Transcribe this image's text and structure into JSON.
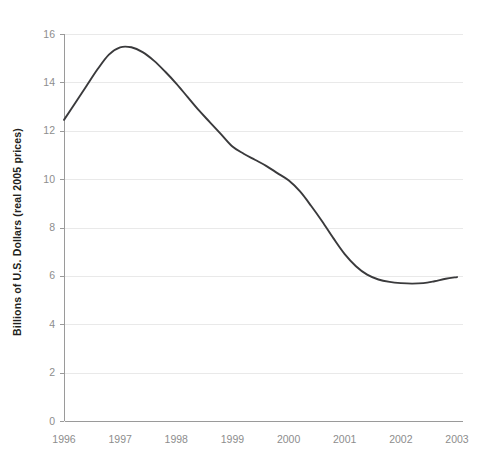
{
  "chart_data": {
    "type": "line",
    "title": "",
    "subtitle": "",
    "xlabel": "",
    "ylabel": "Billions of U.S. Dollars (real 2005 prices)",
    "xlim": [
      1996,
      2003
    ],
    "ylim": [
      0,
      16
    ],
    "y_ticks": [
      0,
      2,
      4,
      6,
      8,
      10,
      12,
      14,
      16
    ],
    "x_ticks": [
      1996,
      1997,
      1998,
      1999,
      2000,
      2001,
      2002,
      2003
    ],
    "y_tick_labels": [
      "0",
      "2",
      "4",
      "6",
      "8",
      "10",
      "12",
      "14",
      "16"
    ],
    "x_tick_labels": [
      "1996",
      "1997",
      "1998",
      "1999",
      "2000",
      "2001",
      "2002",
      "2003"
    ],
    "grid": "horizontal",
    "legend": "none",
    "series": [
      {
        "name": "Value",
        "color": "#3a3a3c",
        "x": [
          1996.0,
          1996.2,
          1996.4,
          1996.6,
          1996.8,
          1997.0,
          1997.2,
          1997.4,
          1997.6,
          1997.8,
          1998.0,
          1998.2,
          1998.4,
          1998.6,
          1998.8,
          1999.0,
          1999.2,
          1999.4,
          1999.6,
          1999.8,
          2000.0,
          2000.2,
          2000.4,
          2000.6,
          2000.8,
          2001.0,
          2001.2,
          2001.4,
          2001.6,
          2001.8,
          2002.0,
          2002.2,
          2002.4,
          2002.6,
          2002.8,
          2003.0
        ],
        "values": [
          12.45,
          13.15,
          13.85,
          14.55,
          15.15,
          15.45,
          15.45,
          15.25,
          14.9,
          14.45,
          13.95,
          13.4,
          12.85,
          12.35,
          11.85,
          11.35,
          11.05,
          10.8,
          10.55,
          10.25,
          9.95,
          9.5,
          8.9,
          8.25,
          7.55,
          6.9,
          6.4,
          6.05,
          5.85,
          5.75,
          5.7,
          5.68,
          5.7,
          5.78,
          5.88,
          5.95
        ]
      }
    ],
    "annotations": {
      "peak_year": "1997",
      "peak_value": "15.45",
      "start_value": "12.45",
      "end_value": "5.95",
      "min_value": "5.68"
    }
  },
  "axis": {
    "y_title": "Billions of U.S. Dollars (real 2005 prices)"
  },
  "geometry": {
    "plot_left": 64,
    "plot_right": 457,
    "grid_right": 463,
    "y_zero_px": 421,
    "y_top_px": 34,
    "px_per_unit": 24.1875,
    "px_per_year": 53.0
  }
}
